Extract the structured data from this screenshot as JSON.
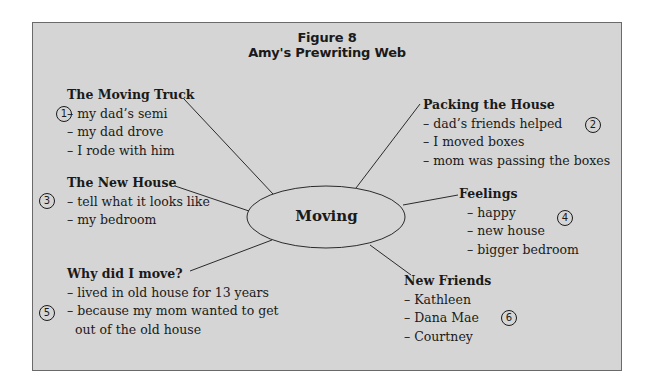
{
  "figure": {
    "label": "Figure 8",
    "title": "Amy's Prewriting Web"
  },
  "center": {
    "label": "Moving"
  },
  "nodes": [
    {
      "number": "1",
      "heading": "The Moving Truck",
      "items": [
        "– my dad’s semi",
        "– my dad drove",
        "– I rode with him"
      ]
    },
    {
      "number": "2",
      "heading": "Packing the House",
      "items": [
        "– dad’s friends helped",
        "– I moved boxes",
        "– mom was passing the boxes"
      ]
    },
    {
      "number": "3",
      "heading": "The New House",
      "items": [
        "– tell what it looks like",
        "– my bedroom"
      ]
    },
    {
      "number": "4",
      "heading": "Feelings",
      "items": [
        "– happy",
        "– new house",
        "– bigger bedroom"
      ]
    },
    {
      "number": "5",
      "heading": "Why did I move?",
      "items": [
        "– lived in old house for 13 years",
        "– because my mom wanted to get",
        "out of the old house"
      ]
    },
    {
      "number": "6",
      "heading": "New Friends",
      "items": [
        "– Kathleen",
        "– Dana Mae",
        "– Courtney"
      ]
    }
  ],
  "colors": {
    "panel_bg": "#d5d5d5",
    "border": "#6a6a6a",
    "ink": "#1a1a1a"
  }
}
